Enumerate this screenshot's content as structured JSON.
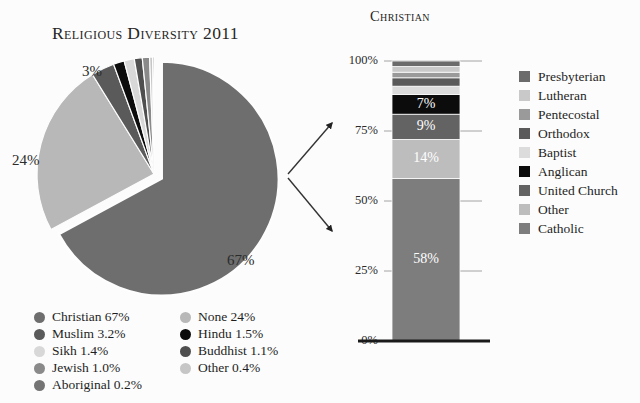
{
  "pie_title": "Religious Diversity 2011",
  "bar_title": "Christian",
  "pie_labels": {
    "christian": "67%",
    "none": "24%",
    "muslim": "3%"
  },
  "pie_legend_col1": [
    {
      "label": "Christian 67%",
      "color": "#6e6e6e"
    },
    {
      "label": "Muslim 3.2%",
      "color": "#5a5a5a"
    },
    {
      "label": "Sikh 1.4%",
      "color": "#d8d8d8"
    },
    {
      "label": "Jewish 1.0%",
      "color": "#8a8a8a"
    },
    {
      "label": "Aboriginal 0.2%",
      "color": "#747474"
    }
  ],
  "pie_legend_col2": [
    {
      "label": "None 24%",
      "color": "#b8b8b8"
    },
    {
      "label": "Hindu 1.5%",
      "color": "#0c0c0c"
    },
    {
      "label": "Buddhist 1.1%",
      "color": "#4f4f4f"
    },
    {
      "label": "Other 0.4%",
      "color": "#c6c6c6"
    }
  ],
  "bar_legend": [
    {
      "label": "Presbyterian",
      "color": "#6b6b6b"
    },
    {
      "label": "Lutheran",
      "color": "#c9c9c9"
    },
    {
      "label": "Pentecostal",
      "color": "#9a9a9a"
    },
    {
      "label": "Orthodox",
      "color": "#5a5a5a"
    },
    {
      "label": "Baptist",
      "color": "#dcdcdc"
    },
    {
      "label": "Anglican",
      "color": "#0c0c0c"
    },
    {
      "label": "United Church",
      "color": "#636363"
    },
    {
      "label": "Other",
      "color": "#bdbdbd"
    },
    {
      "label": "Catholic",
      "color": "#7d7d7d"
    }
  ],
  "bar_axis_ticks": [
    "100%",
    "75%",
    "50%",
    "25%",
    "0%"
  ],
  "chart_data": [
    {
      "type": "pie",
      "title": "Religious Diversity 2011",
      "categories": [
        "Christian",
        "None",
        "Muslim",
        "Hindu",
        "Sikh",
        "Buddhist",
        "Jewish",
        "Other",
        "Aboriginal"
      ],
      "values": [
        67,
        24,
        3.2,
        1.5,
        1.4,
        1.1,
        1.0,
        0.4,
        0.2
      ],
      "value_labels": [
        "67%",
        "24%",
        "3.2%",
        "1.5%",
        "1.4%",
        "1.1%",
        "1.0%",
        "0.4%",
        "0.2%"
      ],
      "displayed_labels": [
        "67%",
        "24%",
        "3%"
      ],
      "colors": [
        "#6e6e6e",
        "#b8b8b8",
        "#5a5a5a",
        "#0c0c0c",
        "#d8d8d8",
        "#4f4f4f",
        "#8a8a8a",
        "#c6c6c6",
        "#747474"
      ],
      "exploded_slice": "Christian",
      "legend_position": "bottom"
    },
    {
      "type": "bar",
      "subtype": "stacked-single-column",
      "title": "Christian",
      "categories": [
        "Christian"
      ],
      "ylabel": "",
      "ylim": [
        0,
        100
      ],
      "yticks": [
        0,
        25,
        50,
        75,
        100
      ],
      "ytick_labels": [
        "0%",
        "25%",
        "50%",
        "75%",
        "100%"
      ],
      "grid": false,
      "legend_position": "right",
      "series": [
        {
          "name": "Catholic",
          "values": [
            58
          ],
          "label": "58%",
          "color": "#7d7d7d"
        },
        {
          "name": "Other",
          "values": [
            14
          ],
          "label": "14%",
          "color": "#bdbdbd"
        },
        {
          "name": "United Church",
          "values": [
            9
          ],
          "label": "9%",
          "color": "#636363"
        },
        {
          "name": "Anglican",
          "values": [
            7
          ],
          "label": "7%",
          "color": "#0c0c0c"
        },
        {
          "name": "Baptist",
          "values": [
            3
          ],
          "label": "",
          "color": "#dcdcdc"
        },
        {
          "name": "Orthodox",
          "values": [
            3
          ],
          "label": "",
          "color": "#5a5a5a"
        },
        {
          "name": "Pentecostal",
          "values": [
            2
          ],
          "label": "",
          "color": "#9a9a9a"
        },
        {
          "name": "Lutheran",
          "values": [
            2
          ],
          "label": "",
          "color": "#c9c9c9"
        },
        {
          "name": "Presbyterian",
          "values": [
            2
          ],
          "label": "",
          "color": "#6b6b6b"
        }
      ]
    }
  ]
}
